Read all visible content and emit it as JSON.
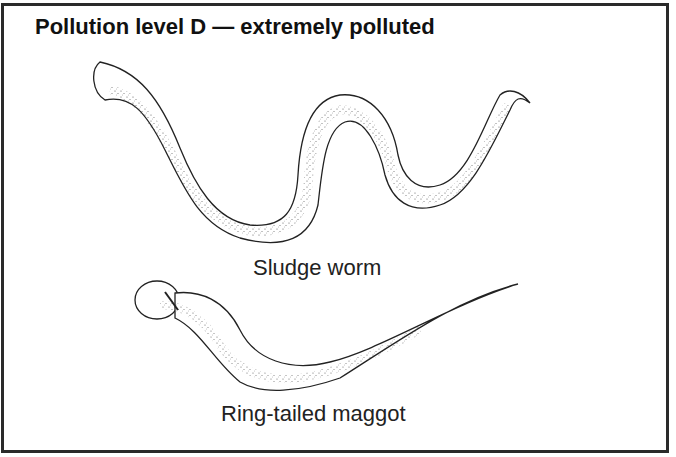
{
  "figure": {
    "title": "Pollution level D — extremely polluted",
    "organisms": [
      {
        "name": "Sludge worm"
      },
      {
        "name": "Ring-tailed maggot"
      }
    ]
  },
  "colors": {
    "ink": "#222222",
    "border": "#2a2a2a",
    "background": "#ffffff"
  }
}
